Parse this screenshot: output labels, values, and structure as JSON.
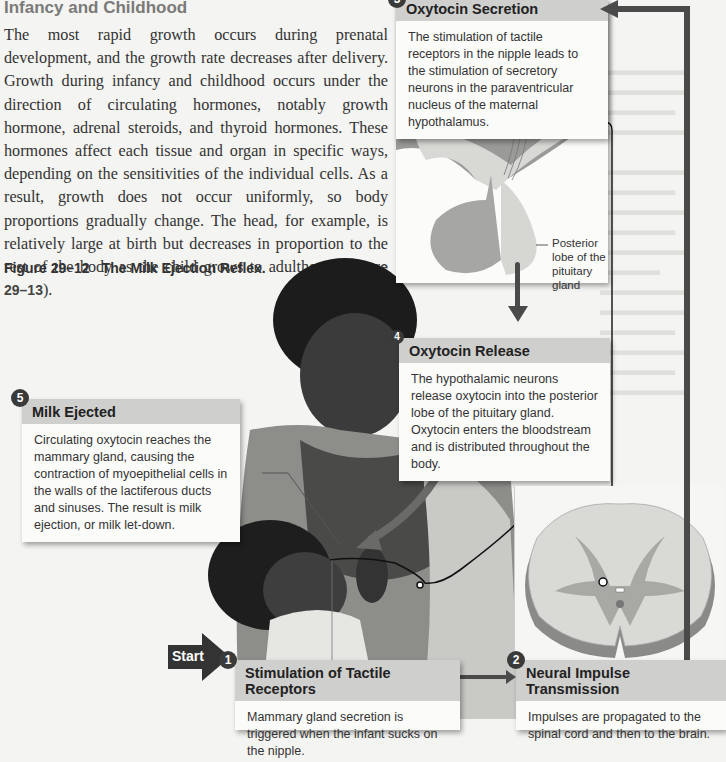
{
  "section": {
    "title": "Infancy and Childhood",
    "paragraph": "The most rapid growth occurs during prenatal development, and the growth rate decreases after delivery. Growth during infancy and childhood occurs under the direction of circulating hormones, notably growth hormone, adrenal steroids, and thyroid hormones. These hormones affect each tissue and organ in specific ways, depending on the sensitivities of the individual cells. As a result, growth does not occur uniformly, so body proportions gradually change. The head, for example, is relatively large at birth but decreases in proportion to the rest of the body as the child grows to adulthood (",
    "figure_ref": "Figure 29–13",
    "paragraph_end": ")."
  },
  "figure": {
    "number": "Figure 29–12",
    "title": "The Milk Ejection Reflex.",
    "start_label": "Start",
    "steps": [
      {
        "num": "1",
        "title": "Stimulation of Tactile Receptors",
        "text": "Mammary gland secretion is triggered when the infant sucks on the nipple."
      },
      {
        "num": "2",
        "title": "Neural Impulse Transmission",
        "text": "Impulses are propagated to the spinal cord and then to the brain."
      },
      {
        "num": "3",
        "title": "Oxytocin Secretion",
        "text": "The stimulation of tactile receptors in the nipple leads to the stimulation of secretory neurons in the paraventricular nucleus of the maternal hypothalamus."
      },
      {
        "num": "4",
        "title": "Oxytocin Release",
        "text": "The hypothalamic neurons release oxytocin into the posterior lobe of the pituitary gland. Oxytocin enters the bloodstream and is distributed throughout the body."
      },
      {
        "num": "5",
        "title": "Milk Ejected",
        "text": "Circulating oxytocin reaches the mammary gland, causing the contraction of myoepithelial cells in the walls of the lactiferous ducts and sinuses. The result is milk ejection, or milk let-down."
      }
    ],
    "pituitary_label": "Posterior lobe of the pituitary gland"
  },
  "colors": {
    "page": "#f4f4f2",
    "box_header": "#cfcfcd",
    "arrow": "#4a4a4a"
  }
}
